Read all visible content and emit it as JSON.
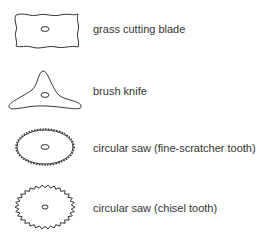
{
  "items": [
    {
      "label": "grass cutting blade",
      "icon": "grass-cutting-blade-icon"
    },
    {
      "label": "brush knife",
      "icon": "brush-knife-icon"
    },
    {
      "label": "circular saw (fine-scratcher tooth)",
      "icon": "fine-tooth-saw-icon"
    },
    {
      "label": "circular saw (chisel tooth)",
      "icon": "chisel-tooth-saw-icon"
    }
  ],
  "colors": {
    "stroke": "#333333",
    "text": "#333333",
    "background": "#ffffff"
  }
}
